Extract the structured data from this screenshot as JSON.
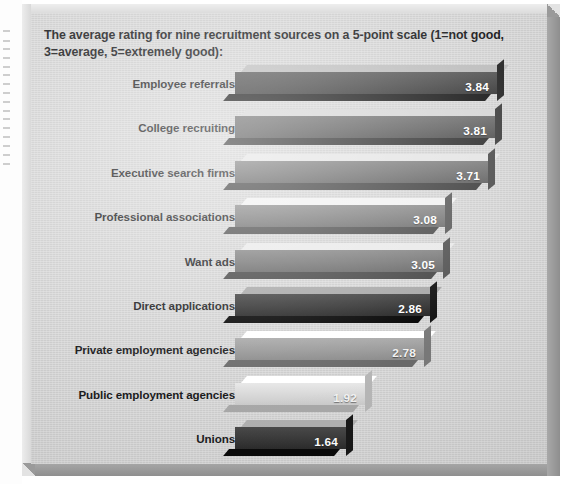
{
  "figure": {
    "title": "The average rating for nine recruitment sources on a 5-point scale (1=not good, 3=average, 5=extremely good):",
    "background_color": "#d2d2d2",
    "frame_color": "#b9b9b9",
    "value_text_color": "#ffffff"
  },
  "chart_data": {
    "type": "bar",
    "orientation": "horizontal",
    "title": "The average rating for nine recruitment sources on a 5-point scale (1=not good, 3=average, 5=extremely good):",
    "xlabel": "",
    "ylabel": "",
    "xlim": [
      0,
      4
    ],
    "grid": false,
    "legend": "none",
    "scale_note": "1=not good, 3=average, 5=extremely good",
    "scale_points": 5,
    "categories": [
      "Employee referrals",
      "College recruiting",
      "Executive search firms",
      "Professional associations",
      "Want ads",
      "Direct applications",
      "Private employment agencies",
      "Public employment agencies",
      "Unions"
    ],
    "values": [
      3.84,
      3.81,
      3.71,
      3.08,
      3.05,
      2.86,
      2.78,
      1.92,
      1.64
    ],
    "value_labels": [
      "3.84",
      "3.81",
      "3.71",
      "3.08",
      "3.05",
      "2.86",
      "2.78",
      "1.92",
      "1.64"
    ],
    "bar_colors": [
      "#464646",
      "#5f5f5f",
      "#6e6e6e",
      "#7b7b7b",
      "#737373",
      "#303030",
      "#9a9a9a",
      "#d8d8d8",
      "#3a3a3a"
    ]
  },
  "bars": [
    {
      "label": "Employee referrals",
      "value": 3.84,
      "display": "3.84",
      "color": "#464646",
      "width": 262,
      "light": false
    },
    {
      "label": "College recruiting",
      "value": 3.81,
      "display": "3.81",
      "color": "#5f5f5f",
      "width": 260,
      "light": false
    },
    {
      "label": "Executive search firms",
      "value": 3.71,
      "display": "3.71",
      "color": "#6e6e6e",
      "width": 253,
      "light": false
    },
    {
      "label": "Professional associations",
      "value": 3.08,
      "display": "3.08",
      "color": "#7b7b7b",
      "width": 210,
      "light": false
    },
    {
      "label": "Want ads",
      "value": 3.05,
      "display": "3.05",
      "color": "#737373",
      "width": 208,
      "light": false
    },
    {
      "label": "Direct applications",
      "value": 2.86,
      "display": "2.86",
      "color": "#303030",
      "width": 195,
      "light": false
    },
    {
      "label": "Private employment agencies",
      "value": 2.78,
      "display": "2.78",
      "color": "#9a9a9a",
      "width": 189,
      "light": true
    },
    {
      "label": "Public employment agencies",
      "value": 1.92,
      "display": "1.92",
      "color": "#d8d8d8",
      "width": 130,
      "light": true
    },
    {
      "label": "Unions",
      "value": 1.64,
      "display": "1.64",
      "color": "#3a3a3a",
      "width": 111,
      "light": false
    }
  ]
}
